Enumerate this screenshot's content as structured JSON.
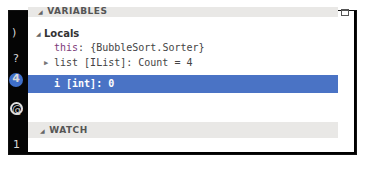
{
  "sidebar": {
    "icons": [
      {
        "name": "paren-icon",
        "glyph": ")"
      },
      {
        "name": "help-icon",
        "glyph": "?"
      },
      {
        "name": "badge-icon",
        "glyph": "4"
      },
      {
        "name": "at-circle-icon",
        "glyph": "@"
      },
      {
        "name": "one-icon",
        "glyph": "1"
      }
    ]
  },
  "variables": {
    "header": "VARIABLES",
    "locals": {
      "label": "Locals",
      "items": [
        {
          "name": "this",
          "value": ": {BubbleSort.Sorter}"
        },
        {
          "name": "list [IList]",
          "value": ": Count = 4"
        },
        {
          "name": "i [int]",
          "value": ": 0"
        }
      ]
    }
  },
  "watch": {
    "header": "WATCH"
  },
  "colors": {
    "selection": "#4a73c5",
    "header_bg": "#e9e8e6",
    "frame": "#000000"
  }
}
